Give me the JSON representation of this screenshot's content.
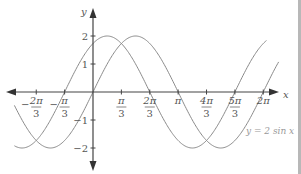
{
  "chart_data": {
    "type": "line",
    "title": "",
    "xlabel": "x",
    "ylabel": "y",
    "xlim": [
      -2.9,
      6.85
    ],
    "ylim": [
      -2.4,
      2.7
    ],
    "grid": false,
    "x_ticks": [
      {
        "value": -2.0944,
        "num": "2π",
        "den": "3",
        "sign": "−"
      },
      {
        "value": -1.0472,
        "num": "π",
        "den": "3",
        "sign": "−"
      },
      {
        "value": 1.0472,
        "num": "π",
        "den": "3",
        "sign": ""
      },
      {
        "value": 2.0944,
        "num": "2π",
        "den": "3",
        "sign": ""
      },
      {
        "value": 3.1416,
        "num": "π",
        "den": "",
        "sign": ""
      },
      {
        "value": 4.1888,
        "num": "4π",
        "den": "3",
        "sign": ""
      },
      {
        "value": 5.236,
        "num": "5π",
        "den": "3",
        "sign": ""
      },
      {
        "value": 6.2832,
        "num": "2π",
        "den": "",
        "sign": ""
      }
    ],
    "y_ticks": [
      {
        "value": 2,
        "label": "2"
      },
      {
        "value": 1,
        "label": "1"
      },
      {
        "value": -1,
        "label": "−1"
      },
      {
        "value": -2,
        "label": "−2"
      }
    ],
    "series": [
      {
        "name": "y = 2 sin x",
        "expr": "2*sin(x)",
        "amplitude": 2,
        "phase": 0,
        "x_range": [
          -2.9,
          6.85
        ],
        "color": "#8a8a8a"
      },
      {
        "name": "y = 2 sin(x + π/3)",
        "expr": "2*sin(x + pi/3)",
        "amplitude": 2,
        "phase": 1.0472,
        "x_range": [
          -2.9,
          6.4
        ],
        "color": "#8a8a8a"
      }
    ],
    "annotations": [
      {
        "text": "y = 2 sin x",
        "x": 5.3,
        "y": -1.0
      }
    ]
  },
  "labels": {
    "x_axis": "x",
    "y_axis": "y",
    "curve_label": "y = 2 sin x"
  }
}
